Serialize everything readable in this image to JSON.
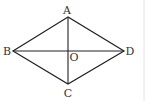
{
  "figure": {
    "type": "rhombus-with-diagonals",
    "points": {
      "A": {
        "label": "A",
        "x": 68,
        "y": 17,
        "label_x": 67,
        "label_y": 14
      },
      "B": {
        "label": "B",
        "x": 13,
        "y": 51,
        "label_x": 7,
        "label_y": 55
      },
      "C": {
        "label": "C",
        "x": 68,
        "y": 84,
        "label_x": 68,
        "label_y": 97
      },
      "D": {
        "label": "D",
        "x": 124,
        "y": 51,
        "label_x": 130,
        "label_y": 55
      },
      "O": {
        "label": "O",
        "x": 68,
        "y": 51,
        "label_x": 74,
        "label_y": 61
      }
    },
    "edges": [
      [
        "A",
        "B"
      ],
      [
        "B",
        "C"
      ],
      [
        "C",
        "D"
      ],
      [
        "D",
        "A"
      ]
    ],
    "diagonals": [
      [
        "A",
        "C"
      ],
      [
        "B",
        "D"
      ]
    ],
    "colors": {
      "line": "#222222",
      "label": "#333333",
      "edge_border": "#e4e4e4"
    }
  }
}
